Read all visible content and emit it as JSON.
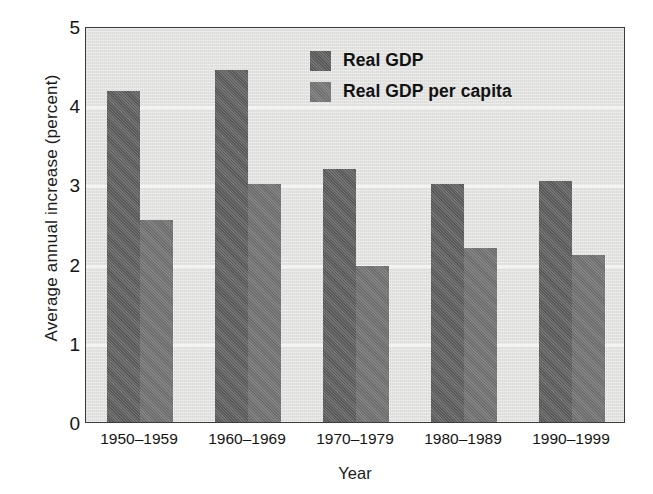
{
  "chart_data": {
    "type": "bar",
    "title": "",
    "xlabel": "Year",
    "ylabel": "Average annual increase (percent)",
    "categories": [
      "1950–1959",
      "1960–1969",
      "1970–1979",
      "1980–1989",
      "1990–1999"
    ],
    "series": [
      {
        "name": "Real GDP",
        "values": [
          4.18,
          4.44,
          3.2,
          3.0,
          3.04
        ],
        "color": "#6b6b6b"
      },
      {
        "name": "Real GDP per capita",
        "values": [
          2.55,
          3.01,
          1.97,
          2.2,
          2.11
        ],
        "color": "#7d7d7d"
      }
    ],
    "ylim": [
      0,
      5
    ],
    "y_ticks": [
      "0",
      "1",
      "2",
      "3",
      "4",
      "5"
    ],
    "grid": true,
    "grid_axis": "y",
    "legend_position": "top-center",
    "plot_background": "#e3e3e1"
  },
  "axes": {
    "y_title": "Average annual increase (percent)",
    "x_title": "Year"
  }
}
